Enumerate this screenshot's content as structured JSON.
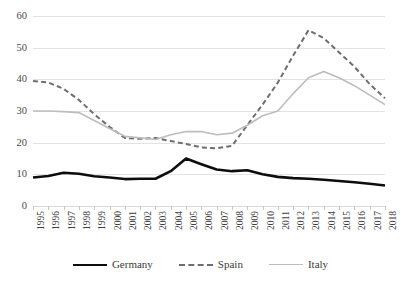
{
  "chart_data": {
    "type": "line",
    "title": "",
    "xlabel": "",
    "ylabel": "",
    "ylim": [
      0,
      60
    ],
    "ytick_values": [
      0,
      10,
      20,
      30,
      40,
      50,
      60
    ],
    "grid": true,
    "legend_position": "bottom",
    "categories": [
      "1995",
      "1996",
      "1997",
      "1998",
      "1999",
      "2000",
      "2001",
      "2002",
      "2003",
      "2004",
      "2005",
      "2006",
      "2007",
      "2008",
      "2009",
      "2010",
      "2011",
      "2012",
      "2013",
      "2014",
      "2015",
      "2016",
      "2017",
      "2018"
    ],
    "series": [
      {
        "name": "Germany",
        "style": "solid",
        "color": "#0d0d0d",
        "width": 2.6,
        "values": [
          9.0,
          9.5,
          10.5,
          10.2,
          9.4,
          9.0,
          8.5,
          8.6,
          8.6,
          11.0,
          15.0,
          13.2,
          11.5,
          11.0,
          11.3,
          10.0,
          9.2,
          8.8,
          8.6,
          8.3,
          7.9,
          7.5,
          7.0,
          6.5
        ]
      },
      {
        "name": "Spain",
        "style": "dashed",
        "color": "#6e6e6e",
        "width": 2.0,
        "values": [
          39.5,
          39.0,
          37.0,
          33.5,
          29.0,
          25.0,
          21.5,
          21.2,
          21.5,
          20.5,
          19.6,
          18.5,
          18.2,
          19.0,
          25.5,
          32.0,
          39.0,
          47.5,
          55.5,
          53.0,
          48.5,
          44.0,
          38.5,
          34.0
        ]
      },
      {
        "name": "Italy",
        "style": "solid",
        "color": "#bdbdbd",
        "width": 1.6,
        "values": [
          30.0,
          30.0,
          29.8,
          29.5,
          27.0,
          24.5,
          22.0,
          21.5,
          21.0,
          22.5,
          23.5,
          23.5,
          22.5,
          23.0,
          25.5,
          28.5,
          30.0,
          35.5,
          40.5,
          42.5,
          40.5,
          38.0,
          35.0,
          32.0
        ]
      }
    ],
    "legend": [
      "Germany",
      "Spain",
      "Italy"
    ]
  },
  "colors": {
    "germany": "#0d0d0d",
    "spain": "#6e6e6e",
    "italy": "#bdbdbd",
    "gridline": "#e3e3e3",
    "text": "#3b3b3b"
  }
}
